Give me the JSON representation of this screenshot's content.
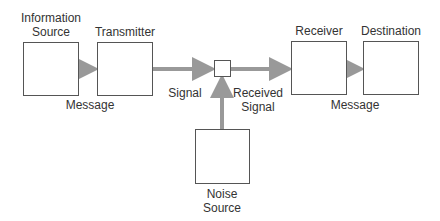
{
  "diagram": {
    "nodes": [
      {
        "id": "info_source",
        "label_line1": "Information",
        "label_line2": "Source"
      },
      {
        "id": "transmitter",
        "label": "Transmitter"
      },
      {
        "id": "mixer",
        "label": ""
      },
      {
        "id": "receiver",
        "label": "Receiver"
      },
      {
        "id": "destination",
        "label": "Destination"
      },
      {
        "id": "noise_source",
        "label_line1": "Noise",
        "label_line2": "Source"
      }
    ],
    "edges": [
      {
        "from": "info_source",
        "to": "transmitter",
        "label": "Message"
      },
      {
        "from": "transmitter",
        "to": "mixer",
        "label": "Signal"
      },
      {
        "from": "mixer",
        "to": "receiver",
        "label_line1": "Received",
        "label_line2": "Signal"
      },
      {
        "from": "receiver",
        "to": "destination",
        "label": "Message"
      },
      {
        "from": "noise_source",
        "to": "mixer",
        "label": ""
      }
    ],
    "colors": {
      "arrow": "#999999",
      "border": "#555555",
      "text": "#333333"
    }
  }
}
